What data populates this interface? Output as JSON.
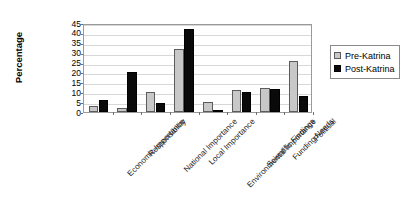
{
  "chart_data": {
    "type": "bar",
    "title": "",
    "xlabel": "",
    "ylabel": "Percentage",
    "ylim": [
      0,
      45
    ],
    "yticks": [
      0,
      5,
      10,
      15,
      20,
      25,
      30,
      35,
      40,
      45
    ],
    "grid": true,
    "legend_position": "right",
    "categories": [
      "Economic Importance",
      "Responsibility",
      "National Importance",
      "Local Importance",
      "Environmental Importance",
      "Scientific Findings",
      "Funding Needs",
      "Political"
    ],
    "series": [
      {
        "name": "Pre-Katrina",
        "color": "#c8c8c8",
        "values": [
          3,
          2,
          10,
          32,
          5,
          11,
          12,
          26
        ]
      },
      {
        "name": "Post-Katrina",
        "color": "#0a0a0a",
        "values": [
          6,
          20,
          4.5,
          42,
          1,
          10,
          11.5,
          8
        ]
      }
    ]
  },
  "legend": {
    "items": [
      {
        "label": "Pre-Katrina",
        "swatch": "pre-katrina-swatch"
      },
      {
        "label": "Post-Katrina",
        "swatch": "post-katrina-swatch"
      }
    ]
  }
}
